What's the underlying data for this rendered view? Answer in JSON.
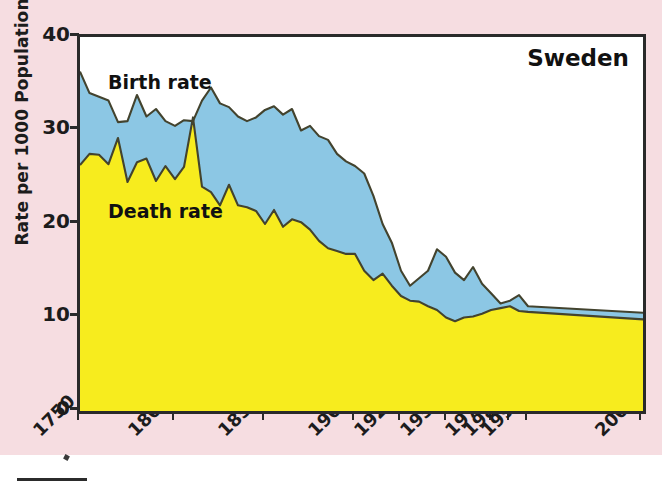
{
  "figure": {
    "title": "Sweden",
    "background_color": "#f6dde1",
    "plot_background_color": "#ffffff",
    "frame_color": "#2a2a2a"
  },
  "annotations": {
    "birth_rate_label": "Birth rate",
    "death_rate_label": "Death rate"
  },
  "axes": {
    "y_axis_title": "Rate per 1000 Population",
    "y_ticks": [
      "0",
      "10",
      "20",
      "30",
      "40"
    ],
    "x_ticks": [
      "1750",
      "1800",
      "1850",
      "1900",
      "1925",
      "1950",
      "1975",
      "1985",
      "1995",
      "2000"
    ]
  },
  "chart_data": {
    "type": "area",
    "title": "Sweden",
    "xlabel": "",
    "ylabel": "Rate per 1000 Population",
    "ylim": [
      0,
      40
    ],
    "xlim": [
      1750,
      2000
    ],
    "grid": false,
    "legend": "in-plot text annotations",
    "x_tick_values": [
      1750,
      1800,
      1850,
      1900,
      1925,
      1950,
      1975,
      1985,
      1995,
      2000
    ],
    "x_axis_scale": "non-linear (compressed after 1900)",
    "colors": {
      "birth_rate_fill": "#8cc7e4",
      "death_rate_fill": "#f7ec1e",
      "line": "#3b3b2a"
    },
    "series": [
      {
        "name": "Birth rate",
        "color": "#8cc7e4",
        "x": [
          1750,
          1755,
          1760,
          1765,
          1770,
          1775,
          1780,
          1785,
          1790,
          1795,
          1800,
          1805,
          1810,
          1815,
          1820,
          1825,
          1830,
          1835,
          1840,
          1845,
          1850,
          1855,
          1860,
          1865,
          1870,
          1875,
          1880,
          1885,
          1890,
          1895,
          1900,
          1905,
          1910,
          1915,
          1920,
          1925,
          1930,
          1935,
          1940,
          1945,
          1950,
          1955,
          1960,
          1965,
          1970,
          1975,
          1980,
          1985,
          1990,
          1995,
          2000
        ],
        "values": [
          36.3,
          34.0,
          33.6,
          33.2,
          30.9,
          31.0,
          33.8,
          31.5,
          32.3,
          31.0,
          30.5,
          31.1,
          31.0,
          33.2,
          34.6,
          32.9,
          32.5,
          31.5,
          31.0,
          31.4,
          32.2,
          32.6,
          31.7,
          32.3,
          30.0,
          30.5,
          29.4,
          29.0,
          27.5,
          26.7,
          26.2,
          25.4,
          23.0,
          20.0,
          18.0,
          15.0,
          13.4,
          14.2,
          15.0,
          17.3,
          16.5,
          14.8,
          14.0,
          15.4,
          13.6,
          12.6,
          11.5,
          11.8,
          12.4,
          11.2,
          10.5
        ]
      },
      {
        "name": "Death rate",
        "color": "#f7ec1e",
        "x": [
          1750,
          1755,
          1760,
          1765,
          1770,
          1775,
          1780,
          1785,
          1790,
          1795,
          1800,
          1805,
          1810,
          1815,
          1820,
          1825,
          1830,
          1835,
          1840,
          1845,
          1850,
          1855,
          1860,
          1865,
          1870,
          1875,
          1880,
          1885,
          1890,
          1895,
          1900,
          1905,
          1910,
          1915,
          1920,
          1925,
          1930,
          1935,
          1940,
          1945,
          1950,
          1955,
          1960,
          1965,
          1970,
          1975,
          1980,
          1985,
          1990,
          1995,
          2000
        ],
        "values": [
          26.3,
          27.5,
          27.4,
          26.4,
          29.2,
          24.5,
          26.6,
          27.0,
          24.6,
          26.2,
          24.8,
          26.1,
          31.4,
          24.0,
          23.4,
          22.0,
          24.2,
          22.0,
          21.8,
          21.4,
          20.0,
          21.5,
          19.7,
          20.5,
          20.2,
          19.4,
          18.2,
          17.4,
          17.1,
          16.8,
          16.8,
          15.0,
          14.0,
          14.7,
          13.4,
          12.3,
          11.8,
          11.7,
          11.2,
          10.8,
          10.0,
          9.6,
          10.0,
          10.1,
          10.4,
          10.8,
          11.0,
          11.2,
          10.7,
          10.6,
          9.8
        ]
      }
    ]
  }
}
